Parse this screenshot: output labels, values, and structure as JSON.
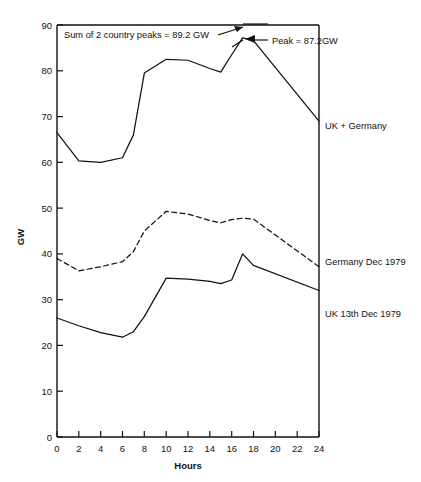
{
  "chart_data": {
    "type": "line",
    "title": "",
    "xlabel": "Hours",
    "ylabel": "GW",
    "xlim": [
      0,
      24
    ],
    "ylim": [
      0,
      90
    ],
    "grid": false,
    "legend_position": "right-inline",
    "xticks": [
      0,
      2,
      4,
      6,
      8,
      10,
      12,
      14,
      16,
      18,
      20,
      22,
      24
    ],
    "yticks": [
      0,
      10,
      20,
      30,
      40,
      50,
      60,
      70,
      80,
      90
    ],
    "x": [
      0,
      2,
      4,
      6,
      7,
      8,
      10,
      12,
      14,
      15,
      16,
      17,
      18,
      24
    ],
    "series": [
      {
        "name": "UK + Germany",
        "style": "solid",
        "values": [
          66.5,
          60.3,
          60.0,
          61.0,
          66.0,
          79.5,
          82.5,
          82.3,
          80.5,
          79.7,
          83.5,
          87.2,
          86.6,
          69.0
        ]
      },
      {
        "name": "Germany Dec 1979",
        "style": "dashed",
        "values": [
          39.0,
          36.3,
          37.2,
          38.3,
          40.5,
          45.0,
          49.3,
          48.7,
          47.3,
          46.8,
          47.5,
          47.8,
          47.6,
          37.2
        ]
      },
      {
        "name": "UK 13th Dec 1979",
        "style": "solid",
        "values": [
          26.0,
          24.3,
          22.8,
          21.8,
          23.0,
          26.3,
          34.7,
          34.5,
          34.0,
          33.5,
          34.3,
          40.0,
          37.5,
          32.0
        ]
      }
    ],
    "annotations": [
      {
        "id": "sum-annotation",
        "text": "Sum of 2 country peaks = 89.2 GW",
        "value": 89.2,
        "unit": "GW"
      },
      {
        "id": "peak-annotation",
        "text": "Peak = 87.2GW",
        "value": 87.2,
        "unit": "GW"
      }
    ]
  },
  "axis": {
    "x_title": "Hours",
    "y_title": "GW",
    "x_tick_labels": [
      "0",
      "2",
      "4",
      "6",
      "8",
      "10",
      "12",
      "14",
      "16",
      "18",
      "20",
      "22",
      "24"
    ],
    "y_tick_labels": [
      "0",
      "10",
      "20",
      "30",
      "40",
      "50",
      "60",
      "70",
      "80",
      "90"
    ]
  },
  "series_labels": {
    "combined": "UK + Germany",
    "germany": "Germany Dec 1979",
    "uk": "UK 13th Dec 1979"
  },
  "annotations": {
    "sum": "Sum of 2 country peaks = 89.2 GW",
    "peak": "Peak = 87.2GW"
  }
}
